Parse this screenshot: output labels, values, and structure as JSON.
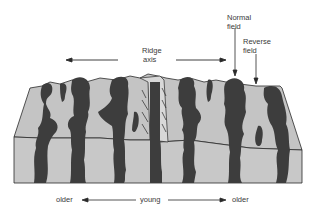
{
  "labels": {
    "ridge_axis_line1": "Ridge",
    "ridge_axis_line2": "axis",
    "normal_field_line1": "Normal",
    "normal_field_line2": "field",
    "reverse_field_line1": "Reverse",
    "reverse_field_line2": "field",
    "bottom_left": "older",
    "bottom_center": "young",
    "bottom_right": "older"
  },
  "colors": {
    "normal_stripe": "#3d3d3d",
    "reverse_crust": "#c4c4c4",
    "outline": "#2a2a2a",
    "background": "#ffffff"
  }
}
